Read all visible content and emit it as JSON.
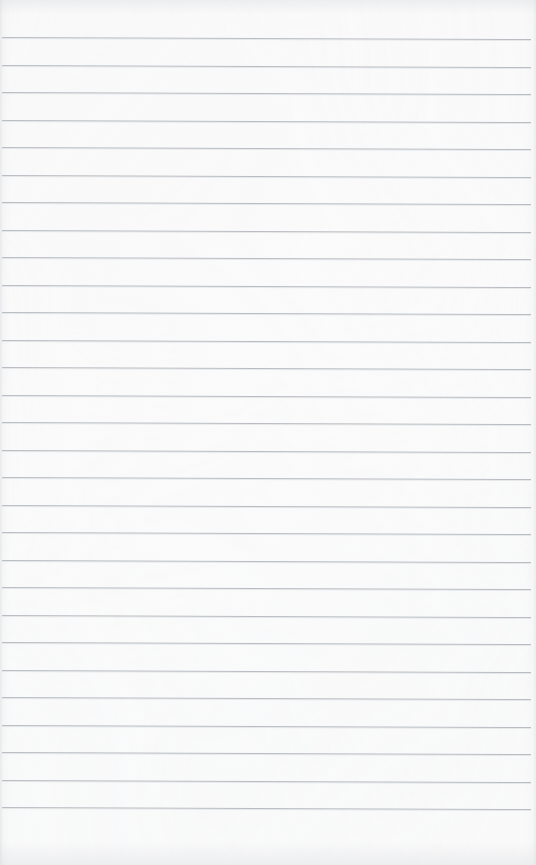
{
  "page": {
    "kind": "lined-notebook-page",
    "width": 536,
    "height": 865,
    "background_color": "#fefefe",
    "rule_color": "#b6babf",
    "content_text": "",
    "handwriting": "",
    "printed_text": "",
    "margin_rule": "none",
    "rules": {
      "count": 29,
      "first_line_y": 37,
      "spacing": 27.5,
      "left_x": 2,
      "right_x": 531,
      "tilt_degrees": 0.22,
      "thickness": 1
    }
  }
}
